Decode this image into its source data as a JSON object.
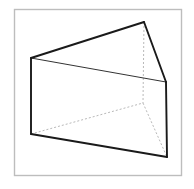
{
  "figure": {
    "canvas": {
      "width": 194,
      "height": 189,
      "background": "#ffffff"
    },
    "frame": {
      "name": "image-border",
      "x": 14.5,
      "y": 9.5,
      "width": 167,
      "height": 166,
      "stroke": "#bdbdbd",
      "stroke_width": 1.4,
      "fill": "#ffffff"
    },
    "colors": {
      "visible_edge": "#1a1a1a",
      "interior_edge": "#333333",
      "hidden_edge": "#b9b9b9",
      "face_fill": "#ffffff",
      "frame": "#bdbdbd"
    },
    "vertices": [
      {
        "id": "A",
        "label": "front-left-top",
        "x": 31,
        "y": 58
      },
      {
        "id": "B",
        "label": "front-left-bottom",
        "x": 31,
        "y": 134
      },
      {
        "id": "C",
        "label": "apex-top",
        "x": 144,
        "y": 22
      },
      {
        "id": "D",
        "label": "front-right-top",
        "x": 166,
        "y": 82
      },
      {
        "id": "E",
        "label": "front-right-bottom",
        "x": 167,
        "y": 157
      },
      {
        "id": "F",
        "label": "hidden-back-corner",
        "x": 143,
        "y": 103
      }
    ],
    "faces": [
      {
        "id": "top-slant-face",
        "label": "Upper slanted face",
        "points": "31,58 144,22 166,82",
        "fill": "#ffffff"
      },
      {
        "id": "front-rect-face",
        "label": "Front rectangular face",
        "points": "31,58 166,82 167,157 31,134",
        "fill": "#ffffff"
      }
    ],
    "visible_edges": [
      {
        "id": "edge-A-C",
        "label": "left-top-to-apex",
        "x1": 31,
        "y1": 58,
        "x2": 144,
        "y2": 22,
        "width": 1.9
      },
      {
        "id": "edge-C-D",
        "label": "apex-to-right-top",
        "x1": 144,
        "y1": 22,
        "x2": 166,
        "y2": 82,
        "width": 1.9
      },
      {
        "id": "edge-A-B",
        "label": "left-vertical",
        "x1": 31,
        "y1": 58,
        "x2": 31,
        "y2": 134,
        "width": 1.9
      },
      {
        "id": "edge-D-E",
        "label": "right-vertical",
        "x1": 166,
        "y1": 82,
        "x2": 167,
        "y2": 157,
        "width": 1.9
      },
      {
        "id": "edge-B-E",
        "label": "bottom-front",
        "x1": 31,
        "y1": 134,
        "x2": 167,
        "y2": 157,
        "width": 1.9
      }
    ],
    "interior_edges": [
      {
        "id": "edge-A-D",
        "label": "front-top-diagonal",
        "x1": 31,
        "y1": 58,
        "x2": 166,
        "y2": 82,
        "width": 1.0
      }
    ],
    "hidden_edges": [
      {
        "id": "edge-C-F",
        "label": "apex-to-back-corner",
        "x1": 144,
        "y1": 22,
        "x2": 143,
        "y2": 103,
        "width": 1.0,
        "dash": "2,2"
      },
      {
        "id": "edge-B-F",
        "label": "bottom-left-to-back",
        "x1": 31,
        "y1": 134,
        "x2": 143,
        "y2": 103,
        "width": 1.0,
        "dash": "2,2"
      },
      {
        "id": "edge-F-E",
        "label": "back-to-bottom-right",
        "x1": 143,
        "y1": 103,
        "x2": 167,
        "y2": 157,
        "width": 1.0,
        "dash": "2,2"
      }
    ]
  }
}
